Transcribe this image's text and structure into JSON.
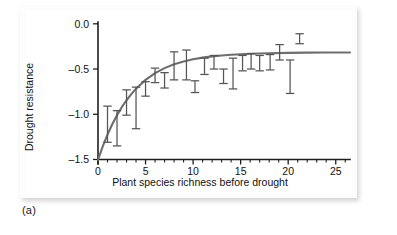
{
  "figure": {
    "caption": "(a)",
    "panel_bg": "#ffffff",
    "curve_color": "#6e6e6e",
    "errorbar_color": "#555555",
    "axis_color": "#1f1f1f"
  },
  "chart_data": {
    "type": "scatter",
    "title": "",
    "subtitle": "",
    "xlabel": "Plant species richness before drought",
    "ylabel": "Drought resistance",
    "xlim": [
      0,
      26.5
    ],
    "ylim": [
      -1.55,
      0.02
    ],
    "xticks": [
      0,
      5,
      10,
      15,
      20,
      25
    ],
    "xtick_labels": [
      "0",
      "5",
      "10",
      "15",
      "20",
      "25"
    ],
    "xticks_minor": [
      1,
      2,
      3,
      4,
      6,
      7,
      8,
      9,
      11,
      12,
      13,
      14,
      16,
      17,
      18,
      19,
      21,
      22,
      23,
      24,
      26
    ],
    "yticks": [
      0.0,
      -0.5,
      -1.0,
      -1.5
    ],
    "ytick_labels": [
      "0.0",
      "-0.5",
      "-1.0",
      "-1.5"
    ],
    "grid": false,
    "legend": null,
    "legend_position": "none",
    "series": [
      {
        "name": "Drought resistance (mean ± SE)",
        "type": "errorbar",
        "x": [
          1.0,
          2.0,
          3.0,
          4.0,
          5.0,
          6.0,
          7.0,
          8.0,
          9.3,
          10.2,
          11.2,
          12.2,
          13.2,
          14.2,
          15.2,
          16.1,
          17.0,
          18.1,
          19.1,
          20.2,
          21.2
        ],
        "y": [
          -1.09,
          -1.15,
          -0.87,
          -0.93,
          -0.73,
          -0.57,
          -0.62,
          -0.46,
          -0.45,
          -0.7,
          -0.47,
          -0.42,
          -0.58,
          -0.45,
          -0.43,
          -0.41,
          -0.42,
          -0.42,
          -0.31,
          -0.52,
          -0.16
        ],
        "y_low": [
          -1.31,
          -1.35,
          -1.01,
          -1.16,
          -0.8,
          -0.65,
          -0.71,
          -0.62,
          -0.62,
          -0.76,
          -0.56,
          -0.5,
          -0.66,
          -0.72,
          -0.52,
          -0.5,
          -0.52,
          -0.51,
          -0.4,
          -0.77,
          -0.22
        ],
        "y_high": [
          -0.91,
          -0.96,
          -0.73,
          -0.7,
          -0.64,
          -0.49,
          -0.54,
          -0.31,
          -0.29,
          -0.63,
          -0.38,
          -0.35,
          -0.5,
          -0.38,
          -0.35,
          -0.33,
          -0.35,
          -0.34,
          -0.23,
          -0.4,
          -0.11
        ]
      },
      {
        "name": "Fitted saturating curve",
        "type": "line",
        "model": "y = -0.345 - 1.16 * exp(-x / 3.6)",
        "x": [
          0.0,
          0.5,
          1.0,
          1.5,
          2.0,
          2.5,
          3.0,
          3.5,
          4.0,
          5.0,
          6.0,
          7.0,
          8.0,
          9.0,
          10.0,
          11.0,
          12.0,
          13.0,
          14.0,
          15.0,
          16.0,
          18.0,
          20.0,
          22.0,
          24.0,
          26.0,
          26.5
        ],
        "y": [
          -1.505,
          -1.355,
          -1.225,
          -1.11,
          -1.01,
          -0.922,
          -0.845,
          -0.777,
          -0.717,
          -0.62,
          -0.546,
          -0.49,
          -0.448,
          -0.416,
          -0.392,
          -0.374,
          -0.36,
          -0.35,
          -0.342,
          -0.336,
          -0.331,
          -0.325,
          -0.321,
          -0.319,
          -0.318,
          -0.317,
          -0.317
        ]
      }
    ]
  }
}
